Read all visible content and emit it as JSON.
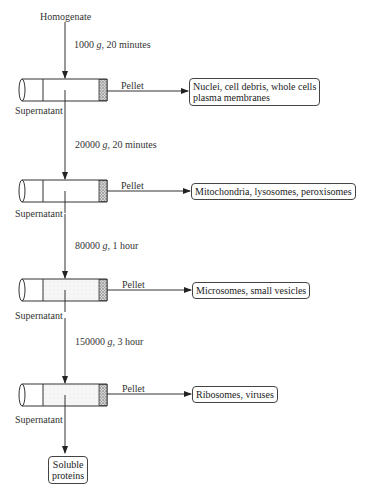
{
  "start_label": "Homogenate",
  "steps": [
    {
      "spin": {
        "speed": "1000",
        "unit": "g",
        "duration": "20 minutes"
      },
      "pellet_label": "Pellet",
      "supernatant_label": "Supernatant",
      "pellet_contents": [
        "Nuclei, cell debris, whole cells",
        "plasma membranes"
      ]
    },
    {
      "spin": {
        "speed": "20000",
        "unit": "g",
        "duration": "20 minutes"
      },
      "pellet_label": "Pellet",
      "supernatant_label": "Supernatant",
      "pellet_contents": [
        "Mitochondria, lysosomes, peroxisomes"
      ]
    },
    {
      "spin": {
        "speed": "80000",
        "unit": "g",
        "duration": "1 hour"
      },
      "pellet_label": "Pellet",
      "supernatant_label": "Supernatant",
      "pellet_contents": [
        "Microsomes, small vesicles"
      ]
    },
    {
      "spin": {
        "speed": "150000",
        "unit": "g",
        "duration": "3 hour"
      },
      "pellet_label": "Pellet",
      "supernatant_label": "Supernatant",
      "pellet_contents": [
        "Ribosomes, viruses"
      ]
    }
  ],
  "final_product": [
    "Soluble",
    "proteins"
  ],
  "colors": {
    "line": "#333333",
    "pellet": "#9a9a9a",
    "supernatant_fill": "#f2f2f2"
  }
}
